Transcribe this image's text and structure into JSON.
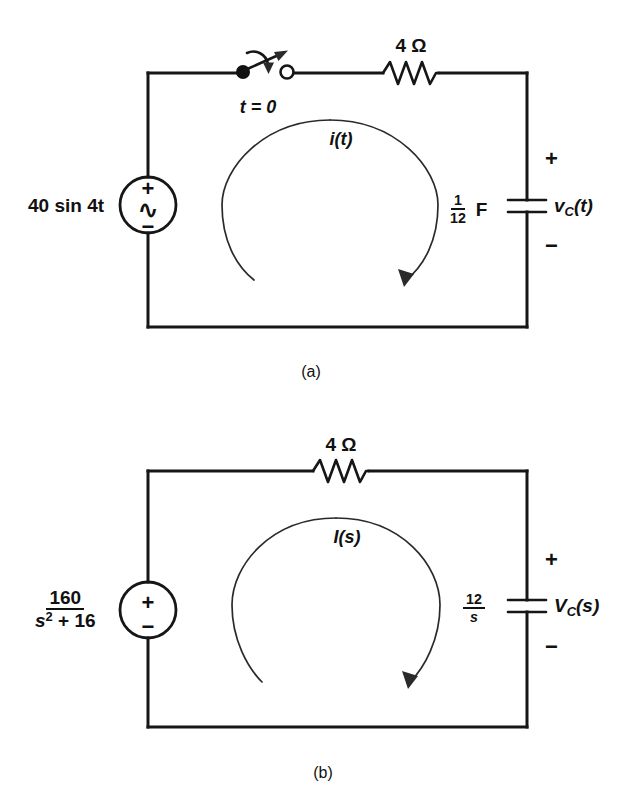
{
  "figure": {
    "caption_a": "(a)",
    "caption_b": "(b)",
    "accent_color": "#161616"
  },
  "circuit_a": {
    "name": "time-domain RC circuit with switch",
    "source": {
      "label": "40 sin 4t",
      "plus": "+",
      "minus": "−",
      "wave": "∿",
      "type": "ac-source"
    },
    "switch": {
      "label": "t = 0",
      "state": "open"
    },
    "resistor": {
      "label": "4 Ω",
      "value": "4",
      "unit": "Ω"
    },
    "capacitor": {
      "value_num": "1",
      "value_den": "12",
      "unit": "F",
      "voltage_label": "v",
      "voltage_sub": "C",
      "voltage_arg": "(t)",
      "plus": "+",
      "minus": "−"
    },
    "loop_current": {
      "label": "i(t)",
      "direction": "clockwise"
    }
  },
  "circuit_b": {
    "name": "s-domain transformed RC circuit",
    "source": {
      "num": "160",
      "den_base": "s",
      "den_exp": "2",
      "den_rest": " + 16",
      "plus": "+",
      "minus": "−",
      "type": "dc-source-symbol"
    },
    "resistor": {
      "label": "4 Ω",
      "value": "4",
      "unit": "Ω"
    },
    "capacitor": {
      "value_num": "12",
      "value_den": "s",
      "voltage_label": "V",
      "voltage_sub": "C",
      "voltage_arg": "(s)",
      "plus": "+",
      "minus": "−"
    },
    "loop_current": {
      "label": "I(s)",
      "direction": "clockwise"
    }
  }
}
